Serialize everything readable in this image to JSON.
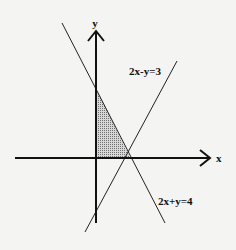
{
  "diagram": {
    "type": "linear-inequality-graph",
    "axes": {
      "x_label": "x",
      "y_label": "y"
    },
    "lines": [
      {
        "id": "line-a",
        "label": "2x-y=3",
        "equation": "2x - y = 3"
      },
      {
        "id": "line-b",
        "label": "2x+y=4",
        "equation": "2x + y = 4"
      }
    ],
    "shaded_region": {
      "description": "Triangle bounded by the y-axis, x-axis and line 2x+y=4 (first quadrant)",
      "fill_color": "#9a9a9a"
    },
    "colors": {
      "background": "#f4f4f2",
      "ink": "#111111"
    }
  }
}
